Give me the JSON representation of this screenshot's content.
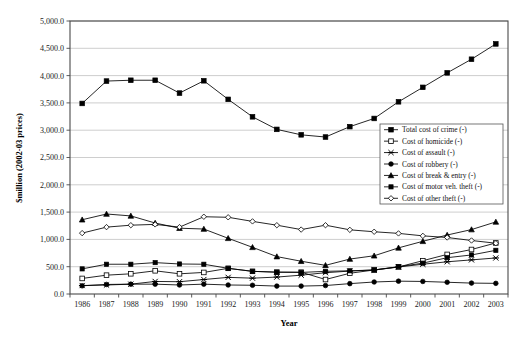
{
  "chart_data": {
    "type": "line",
    "title": "",
    "xlabel": "Year",
    "ylabel": "$million (2002-03 prices)",
    "x": [
      1986,
      1987,
      1988,
      1989,
      1990,
      1991,
      1992,
      1993,
      1994,
      1995,
      1996,
      1997,
      1998,
      1999,
      2000,
      2001,
      2002,
      2003
    ],
    "categories": [
      "1986",
      "1987",
      "1988",
      "1989",
      "1990",
      "1991",
      "1992",
      "1993",
      "1994",
      "1995",
      "1996",
      "1997",
      "1998",
      "1999",
      "2000",
      "2001",
      "2002",
      "2003"
    ],
    "ylim": [
      0,
      5000
    ],
    "ytick_values": [
      0,
      500,
      1000,
      1500,
      2000,
      2500,
      3000,
      3500,
      4000,
      4500,
      5000
    ],
    "ytick_labels": [
      "0.0",
      "500.0",
      "1,000.0",
      "1,500.0",
      "2,000.0",
      "2,500.0",
      "3,000.0",
      "3,500.0",
      "4,000.0",
      "4,500.0",
      "5,000.0"
    ],
    "grid": true,
    "grid_axis": "y",
    "legend_position": "center-right",
    "series": [
      {
        "name": "Total cost of crime (-)",
        "marker": "filled-square",
        "values": [
          3490,
          3900,
          3915,
          3915,
          3680,
          3905,
          3565,
          3245,
          3015,
          2915,
          2875,
          3065,
          3215,
          3520,
          3785,
          4050,
          4300,
          4580
        ]
      },
      {
        "name": "Cost of homicide (-)",
        "marker": "open-square",
        "values": [
          285,
          345,
          370,
          425,
          370,
          395,
          470,
          415,
          400,
          400,
          265,
          380,
          440,
          495,
          610,
          725,
          815,
          935
        ]
      },
      {
        "name": "Cost of assault (-)",
        "marker": "cross-x",
        "values": [
          155,
          165,
          180,
          230,
          225,
          265,
          305,
          290,
          310,
          345,
          390,
          420,
          440,
          495,
          545,
          590,
          625,
          660
        ]
      },
      {
        "name": "Cost of robbery (-)",
        "marker": "filled-circle",
        "values": [
          150,
          175,
          180,
          180,
          165,
          180,
          165,
          160,
          145,
          145,
          155,
          190,
          220,
          235,
          230,
          215,
          200,
          195
        ]
      },
      {
        "name": "Cost of break & entry (-)",
        "marker": "filled-triangle",
        "values": [
          1360,
          1465,
          1430,
          1300,
          1205,
          1190,
          1020,
          855,
          685,
          600,
          525,
          640,
          700,
          845,
          965,
          1080,
          1180,
          1320
        ]
      },
      {
        "name": "Cost of motor veh. theft (-)",
        "marker": "filled-square-small",
        "values": [
          460,
          545,
          545,
          575,
          550,
          545,
          470,
          415,
          400,
          395,
          415,
          425,
          440,
          500,
          565,
          665,
          715,
          800
        ]
      },
      {
        "name": "Cost of other theft (-)",
        "marker": "open-diamond",
        "values": [
          1115,
          1225,
          1260,
          1275,
          1225,
          1415,
          1405,
          1330,
          1260,
          1180,
          1260,
          1175,
          1140,
          1110,
          1065,
          1035,
          980,
          930
        ]
      }
    ]
  },
  "axes": {
    "x_title": "Year",
    "y_title": "$million (2002-03 prices)"
  }
}
